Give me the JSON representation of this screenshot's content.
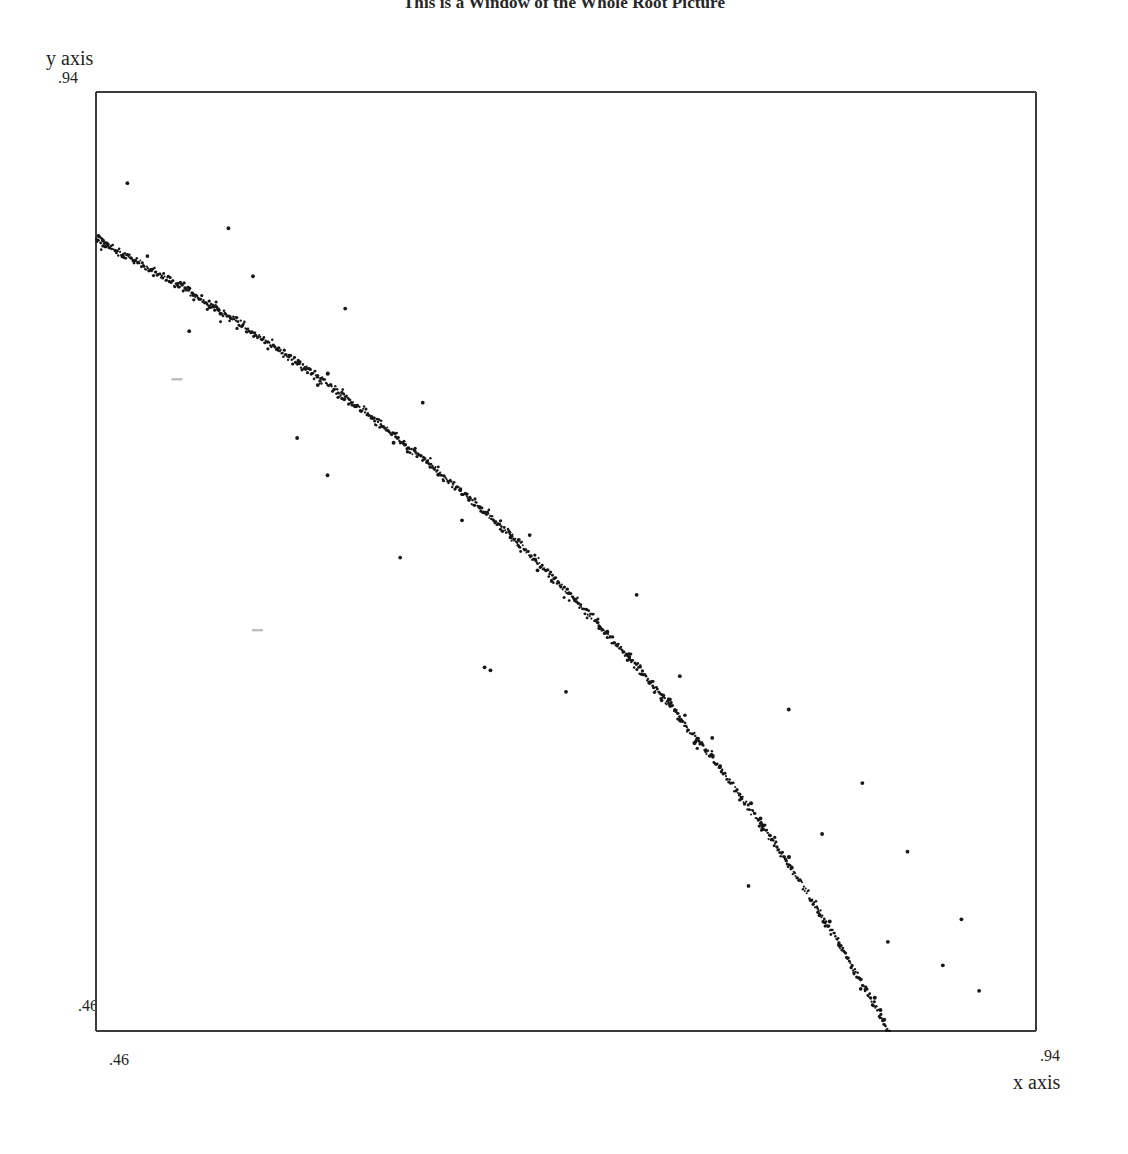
{
  "title": "This is a Window of the Whole Root Picture",
  "axes": {
    "y_label": "y axis",
    "x_label": "x axis",
    "y_tick_top": ".94",
    "y_tick_bottom": ".46",
    "x_tick_left": ".46",
    "x_tick_right": ".94"
  },
  "colors": {
    "background": "#ffffff",
    "frame": "#3c3c3c",
    "marker": "#171717",
    "text": "#1f1f1f",
    "faint_marker": "#b9b9b9"
  },
  "chart_data": {
    "type": "scatter",
    "title": "This is a Window of the Whole Root Picture",
    "xlabel": "x axis",
    "ylabel": "y axis",
    "xlim": [
      0.46,
      0.94
    ],
    "ylim": [
      0.46,
      0.94
    ],
    "xticks": [
      0.46,
      0.94
    ],
    "yticks": [
      0.46,
      0.94
    ],
    "xticklabels": [
      ".46",
      ".94"
    ],
    "yticklabels": [
      ".46",
      ".94"
    ],
    "grid": false,
    "legend": null,
    "marker": "point",
    "marker_size": 1,
    "series": [
      {
        "name": "root locus band",
        "comment": "arc points, x from 0.46 to 0.885; y follows y = sqrt(r^2 - x^2) with r chosen so the arc meets both limits",
        "arc": {
          "radius": 0.9795,
          "cx": 0.0,
          "cy": 0.0,
          "x_start": 0.4605,
          "x_end": 0.8855,
          "n_points": 900,
          "jitter": 0.0022
        }
      },
      {
        "name": "outliers",
        "x": [
          0.4765,
          0.528,
          0.5405,
          0.508,
          0.5875,
          0.5735,
          0.601,
          0.627,
          0.5785,
          0.647,
          0.6855,
          0.6815,
          0.717,
          0.736,
          0.7,
          0.758,
          0.7745,
          0.8135,
          0.851,
          0.874,
          0.9015,
          0.8305,
          0.6585,
          0.6615,
          0.793,
          0.892,
          0.9105,
          0.6155,
          0.563,
          0.864
        ],
        "y": [
          0.893,
          0.87,
          0.8455,
          0.8175,
          0.829,
          0.79,
          0.7735,
          0.781,
          0.744,
          0.721,
          0.6955,
          0.7135,
          0.666,
          0.683,
          0.6335,
          0.6415,
          0.61,
          0.6245,
          0.587,
          0.552,
          0.5175,
          0.561,
          0.646,
          0.6445,
          0.5345,
          0.494,
          0.481,
          0.702,
          0.763,
          0.506
        ]
      },
      {
        "name": "faint marks",
        "x": [
          0.5015,
          0.5425
        ],
        "y": [
          0.793,
          0.665
        ],
        "color": "#b9b9b9"
      }
    ]
  }
}
